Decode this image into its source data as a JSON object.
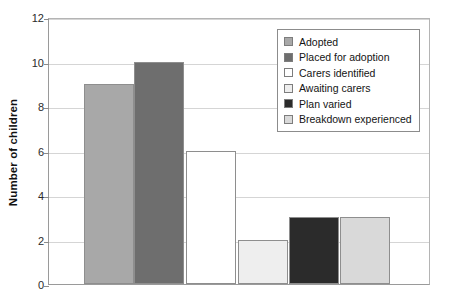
{
  "chart_data": {
    "type": "bar",
    "title": "",
    "subtitle": "",
    "xlabel": "",
    "ylabel": "Number of children",
    "ylim": [
      0,
      12
    ],
    "ytick_values": [
      0,
      2,
      4,
      6,
      8,
      10,
      12
    ],
    "ytick_labels": [
      "0",
      "2",
      "4",
      "6",
      "8",
      "10",
      "12"
    ],
    "xtick_labels": [],
    "grid": "horizontal",
    "legend_position": "top-right",
    "categories": [
      "Adopted",
      "Placed for adoption",
      "Carers identified",
      "Awaiting carers",
      "Plan varied",
      "Breakdown experienced"
    ],
    "values": [
      9,
      10,
      6,
      2,
      3,
      3
    ],
    "series": [
      {
        "name": "Number of children",
        "values": [
          9,
          10,
          6,
          2,
          3,
          3
        ]
      }
    ],
    "bar_colors": [
      "#a8a8a8",
      "#6e6e6e",
      "#ffffff",
      "#eeeeee",
      "#2b2b2b",
      "#d9d9d9"
    ],
    "bar_edge_color": "#8e8e8e",
    "axis_color": "#9a9a9a",
    "gridline_color": "#d5d5d5",
    "background_color": "#ffffff"
  },
  "legend": {
    "items": [
      {
        "label": "Adopted",
        "color": "#a8a8a8"
      },
      {
        "label": "Placed for adoption",
        "color": "#6e6e6e"
      },
      {
        "label": "Carers identified",
        "color": "#ffffff"
      },
      {
        "label": "Awaiting carers",
        "color": "#eeeeee"
      },
      {
        "label": "Plan varied",
        "color": "#2b2b2b"
      },
      {
        "label": "Breakdown experienced",
        "color": "#d9d9d9"
      }
    ]
  },
  "axis": {
    "y_title": "Number of children"
  },
  "geometry": {
    "bar_left_px": [
      35,
      85,
      137,
      189,
      240,
      291
    ],
    "bar_width_px": 50
  }
}
